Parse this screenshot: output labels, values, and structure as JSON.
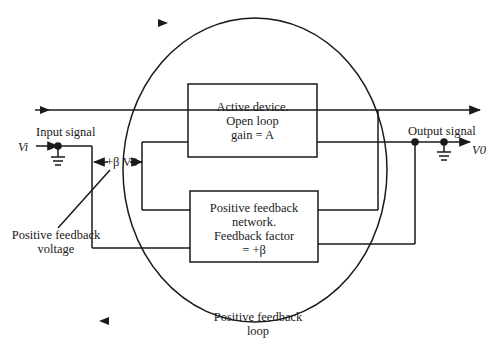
{
  "diagram": {
    "active_device": {
      "line1": "Active device.",
      "line2": "Open loop",
      "line3": "gain = A"
    },
    "feedback_network": {
      "line1": "Positive feedback",
      "line2": "network.",
      "line3": "Feedback factor",
      "line4": "=  +β"
    },
    "labels": {
      "input_signal": "Input signal",
      "input_symbol": "Vi",
      "output_signal": "Output signal",
      "output_symbol": "V0",
      "feedback_term": "+β V0",
      "feedback_voltage_line1": "Positive feedback",
      "feedback_voltage_line2": "voltage",
      "loop_line1": "Positive feedback",
      "loop_line2": "loop"
    },
    "colors": {
      "line": "#1a1a1a",
      "background": "#ffffff"
    }
  }
}
